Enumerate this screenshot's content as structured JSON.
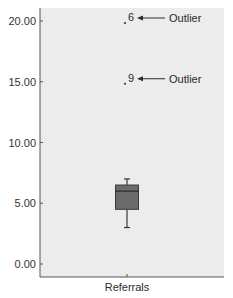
{
  "chart_data": {
    "type": "boxplot",
    "title": "",
    "xlabel": "Referrals",
    "ylabel": "",
    "categories": [
      "Referrals"
    ],
    "ylim": [
      -0.8,
      20.8
    ],
    "yticks": [
      0,
      5,
      10,
      15,
      20
    ],
    "ytick_labels": [
      "0.00",
      "5.00",
      "10.00",
      "15.00",
      "20.00"
    ],
    "grid": false,
    "series": [
      {
        "name": "Referrals",
        "whisker_low": 3.0,
        "q1": 4.5,
        "median": 6.0,
        "q3": 6.5,
        "whisker_high": 7.0,
        "outliers": [
          {
            "case": "6",
            "value": 20.0
          },
          {
            "case": "9",
            "value": 15.0
          }
        ]
      }
    ],
    "annotations": [
      {
        "text": "Outlier",
        "points_to": "6",
        "value": 20.0
      },
      {
        "text": "Outlier",
        "points_to": "9",
        "value": 15.0
      }
    ],
    "colors": {
      "plot_background": "#ececec",
      "box_fill": "#6b6b6b",
      "box_stroke": "#3a3a3a",
      "axis": "#555555"
    }
  }
}
